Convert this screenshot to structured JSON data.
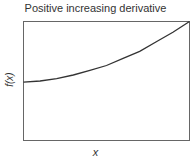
{
  "chart_data": {
    "type": "line",
    "title": "Positive increasing derivative",
    "xlabel": "x",
    "ylabel": "f(x)",
    "grid": false,
    "legend": null,
    "x": [
      0,
      0.1,
      0.2,
      0.3,
      0.4,
      0.5,
      0.6,
      0.7,
      0.8,
      0.9,
      1.0
    ],
    "series": [
      {
        "name": "f(x)",
        "values": [
          0.49,
          0.5,
          0.52,
          0.55,
          0.59,
          0.63,
          0.69,
          0.75,
          0.83,
          0.91,
          1.0
        ]
      }
    ],
    "xlim": [
      0,
      1
    ],
    "ylim": [
      0,
      1
    ],
    "line_color": "#333333"
  }
}
